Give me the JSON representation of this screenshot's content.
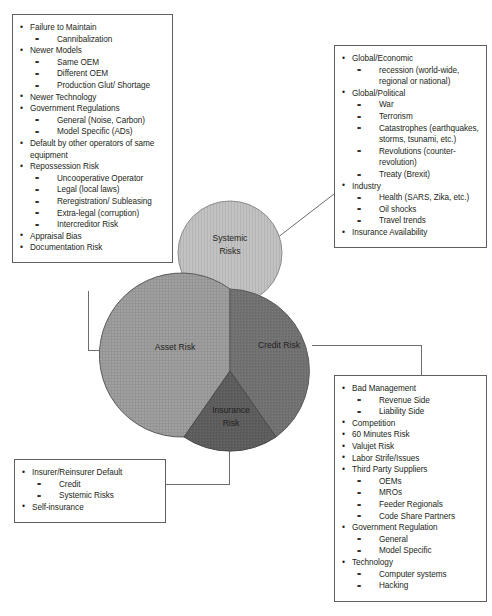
{
  "diagram": {
    "colors": {
      "systemic_fill": "#bdbdbd",
      "asset_fill": "#9c9c9c",
      "credit_fill": "#6e6e6e",
      "insurance_fill": "#5a5a5a",
      "stroke": "#4d4d4d",
      "line": "#6d6d6d",
      "text": "#231f20",
      "box_border": "#5f5f5f"
    },
    "segments": [
      {
        "id": "systemic",
        "label_line1": "Systemic",
        "label_line2": "Risks"
      },
      {
        "id": "asset",
        "label_line1": "Asset Risk",
        "label_line2": ""
      },
      {
        "id": "credit",
        "label_line1": "Credit Risk",
        "label_line2": ""
      },
      {
        "id": "insurance",
        "label_line1": "Insurance",
        "label_line2": "Risk"
      }
    ]
  },
  "boxes": {
    "asset": {
      "name": "Asset Risk",
      "items": [
        {
          "level": 1,
          "text": "Failure to Maintain"
        },
        {
          "level": 2,
          "text": "Cannibalization"
        },
        {
          "level": 1,
          "text": "Newer Models"
        },
        {
          "level": 2,
          "text": "Same OEM"
        },
        {
          "level": 2,
          "text": "Different OEM"
        },
        {
          "level": 2,
          "text": "Production Glut/ Shortage"
        },
        {
          "level": 1,
          "text": "Newer Technology"
        },
        {
          "level": 1,
          "text": "Government Regulations"
        },
        {
          "level": 2,
          "text": "General (Noise, Carbon)"
        },
        {
          "level": 2,
          "text": "Model Specific (ADs)"
        },
        {
          "level": 1,
          "text": "Default by other operators of same equipment"
        },
        {
          "level": 1,
          "text": "Repossession Risk"
        },
        {
          "level": 2,
          "text": "Uncooperative Operator"
        },
        {
          "level": 2,
          "text": "Legal (local laws)"
        },
        {
          "level": 2,
          "text": "Reregistration/ Subleasing"
        },
        {
          "level": 2,
          "text": "Extra-legal (corruption)"
        },
        {
          "level": 2,
          "text": "Intercreditor Risk"
        },
        {
          "level": 1,
          "text": "Appraisal Bias"
        },
        {
          "level": 1,
          "text": "Documentation Risk"
        }
      ]
    },
    "systemic": {
      "name": "Systemic Risks",
      "items": [
        {
          "level": 1,
          "text": "Global/Economic"
        },
        {
          "level": 2,
          "text": "recession (world-wide, regional or national)"
        },
        {
          "level": 1,
          "text": "Global/Political"
        },
        {
          "level": 2,
          "text": "War"
        },
        {
          "level": 2,
          "text": "Terrorism"
        },
        {
          "level": 2,
          "text": "Catastrophes (earthquakes, storms, tsunami, etc.)"
        },
        {
          "level": 2,
          "text": "Revolutions (counter-revolution)"
        },
        {
          "level": 2,
          "text": "Treaty (Brexit)"
        },
        {
          "level": 1,
          "text": "Industry"
        },
        {
          "level": 2,
          "text": "Health (SARS, Zika, etc.)"
        },
        {
          "level": 2,
          "text": "Oil shocks"
        },
        {
          "level": 2,
          "text": "Travel trends"
        },
        {
          "level": 1,
          "text": "Insurance Availability"
        }
      ]
    },
    "credit": {
      "name": "Credit Risk",
      "items": [
        {
          "level": 1,
          "text": "Bad Management"
        },
        {
          "level": 2,
          "text": "Revenue Side"
        },
        {
          "level": 2,
          "text": "Liability Side"
        },
        {
          "level": 1,
          "text": "Competition"
        },
        {
          "level": 1,
          "text": "60 Minutes Risk"
        },
        {
          "level": 1,
          "text": "Valujet Risk"
        },
        {
          "level": 1,
          "text": "Labor Strife/Issues"
        },
        {
          "level": 1,
          "text": "Third Party Suppliers"
        },
        {
          "level": 2,
          "text": "OEMs"
        },
        {
          "level": 2,
          "text": "MROs"
        },
        {
          "level": 2,
          "text": "Feeder Regionals"
        },
        {
          "level": 2,
          "text": "Code Share Partners"
        },
        {
          "level": 1,
          "text": "Government Regulation"
        },
        {
          "level": 2,
          "text": "General"
        },
        {
          "level": 2,
          "text": "Model Specific"
        },
        {
          "level": 1,
          "text": "Technology"
        },
        {
          "level": 2,
          "text": "Computer systems"
        },
        {
          "level": 2,
          "text": "Hacking"
        }
      ]
    },
    "insurance": {
      "name": "Insurance Risk",
      "items": [
        {
          "level": 1,
          "text": "Insurer/Reinsurer Default"
        },
        {
          "level": 2,
          "text": "Credit"
        },
        {
          "level": 2,
          "text": "Systemic Risks"
        },
        {
          "level": 1,
          "text": "Self-insurance"
        }
      ]
    }
  }
}
